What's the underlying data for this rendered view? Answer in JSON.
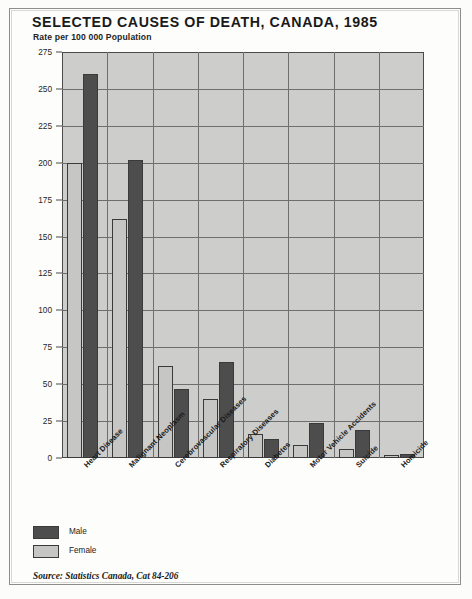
{
  "header": {
    "title": "SELECTED CAUSES OF DEATH, CANADA, 1985",
    "subtitle": "Rate per 100 000 Population"
  },
  "legend": {
    "items": [
      {
        "label": "Male",
        "color": "#4d4d4d"
      },
      {
        "label": "Female",
        "color": "#c6c6c4"
      }
    ]
  },
  "source": "Source: Statistics Canada, Cat 84-206",
  "chart_data": {
    "type": "bar",
    "title": "SELECTED CAUSES OF DEATH, CANADA, 1985",
    "subtitle": "Rate per 100 000 Population",
    "xlabel": "",
    "ylabel": "Rate per 100 000 Population",
    "ylim": [
      0,
      275
    ],
    "yticks": [
      0,
      25,
      50,
      75,
      100,
      125,
      150,
      175,
      200,
      225,
      250,
      275
    ],
    "grid": true,
    "legend_position": "below-left",
    "categories": [
      "Heart Disease",
      "Malignant Neoplasm",
      "Cerebrovascular Diseases",
      "Respiratory Diseases",
      "Diabetes",
      "Motor Vehicle Accidents",
      "Suicide",
      "Homicide"
    ],
    "series": [
      {
        "name": "Female",
        "color": "#c6c6c4",
        "values": [
          200,
          162,
          62,
          40,
          16,
          9,
          6,
          2
        ]
      },
      {
        "name": "Male",
        "color": "#4d4d4d",
        "values": [
          260,
          202,
          47,
          65,
          13,
          24,
          19,
          3
        ]
      }
    ]
  }
}
